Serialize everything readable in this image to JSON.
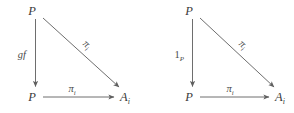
{
  "figure": {
    "type": "commutative-diagram-pair",
    "background_color": "#ffffff",
    "stroke_color": "#6e6e6e",
    "text_color": "#3a3a3a"
  },
  "diagrams": [
    {
      "id": "left-diagram",
      "name": "left-commutative-triangle",
      "vertices": {
        "top_left": {
          "base": "P",
          "sub": ""
        },
        "bottom_left": {
          "base": "P",
          "sub": ""
        },
        "bottom_right": {
          "base": "A",
          "sub": "i"
        }
      },
      "edges": {
        "vertical": {
          "label_base": "gf",
          "label_sub": "",
          "italic": true,
          "from": "top_left",
          "to": "bottom_left"
        },
        "diagonal": {
          "label_base": "π",
          "label_sub": "i",
          "italic": true,
          "from": "top_left",
          "to": "bottom_right"
        },
        "horizontal": {
          "label_base": "π",
          "label_sub": "i",
          "italic": true,
          "from": "bottom_left",
          "to": "bottom_right"
        }
      }
    },
    {
      "id": "right-diagram",
      "name": "right-commutative-triangle",
      "vertices": {
        "top_left": {
          "base": "P",
          "sub": ""
        },
        "bottom_left": {
          "base": "P",
          "sub": ""
        },
        "bottom_right": {
          "base": "A",
          "sub": "i"
        }
      },
      "edges": {
        "vertical": {
          "label_base": "1",
          "label_sub": "P",
          "italic": false,
          "from": "top_left",
          "to": "bottom_left"
        },
        "diagonal": {
          "label_base": "π",
          "label_sub": "i",
          "italic": true,
          "from": "top_left",
          "to": "bottom_right"
        },
        "horizontal": {
          "label_base": "π",
          "label_sub": "i",
          "italic": true,
          "from": "bottom_left",
          "to": "bottom_right"
        }
      }
    }
  ]
}
